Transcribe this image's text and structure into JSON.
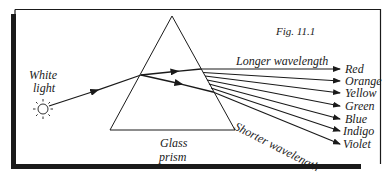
{
  "figure": {
    "title": "Fig. 11.1",
    "source_label_line1": "White",
    "source_label_line2": "light",
    "prism_label_line1": "Glass",
    "prism_label_line2": "prism",
    "longer_label": "Longer wavelength",
    "shorter_label": "Shorter wavelength"
  },
  "spectrum": [
    {
      "name": "Red",
      "y": 69
    },
    {
      "name": "Orange",
      "y": 81
    },
    {
      "name": "Yellow",
      "y": 93
    },
    {
      "name": "Green",
      "y": 106
    },
    {
      "name": "Blue",
      "y": 119
    },
    {
      "name": "Indigo",
      "y": 131
    },
    {
      "name": "Violet",
      "y": 144
    }
  ],
  "colors": {
    "line": "#1a1a1a",
    "background": "#ffffff"
  }
}
